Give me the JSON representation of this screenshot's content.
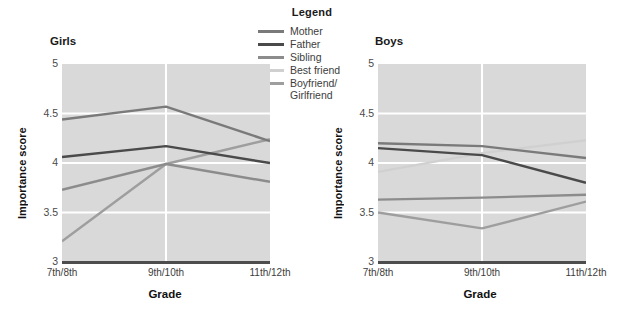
{
  "legend": {
    "title": "Legend",
    "entries": [
      {
        "label": "Mother",
        "color": "#7a7a7a"
      },
      {
        "label": "Father",
        "color": "#4a4a4a"
      },
      {
        "label": "Sibling",
        "color": "#8c8c8c"
      },
      {
        "label": "Best friend",
        "color": "#d0d0d0"
      },
      {
        "label": "Boyfriend/\nGirlfriend",
        "color": "#9e9e9e"
      }
    ]
  },
  "chart_data": [
    {
      "type": "line",
      "title": "Girls",
      "xlabel": "Grade",
      "ylabel": "Importance score",
      "categories": [
        "7th/8th",
        "9th/10th",
        "11th/12th"
      ],
      "ylim": [
        3,
        5
      ],
      "yticks": [
        3,
        3.5,
        4,
        4.5,
        5
      ],
      "grid": true,
      "legend_position": "top-center-shared",
      "series": [
        {
          "name": "Mother",
          "color": "#7a7a7a",
          "values": [
            4.44,
            4.57,
            4.22
          ]
        },
        {
          "name": "Father",
          "color": "#4a4a4a",
          "values": [
            4.06,
            4.17,
            4.0
          ]
        },
        {
          "name": "Sibling",
          "color": "#8c8c8c",
          "values": [
            3.73,
            3.99,
            3.81
          ]
        },
        {
          "name": "Best friend",
          "color": "#d0d0d0",
          "values": [
            null,
            null,
            null
          ]
        },
        {
          "name": "Boyfriend/Girlfriend",
          "color": "#9e9e9e",
          "values": [
            3.21,
            3.99,
            4.24
          ]
        }
      ]
    },
    {
      "type": "line",
      "title": "Boys",
      "xlabel": "Grade",
      "ylabel": "Importance score",
      "categories": [
        "7th/8th",
        "9th/10th",
        "11th/12th"
      ],
      "ylim": [
        3,
        5
      ],
      "yticks": [
        3,
        3.5,
        4,
        4.5,
        5
      ],
      "grid": true,
      "legend_position": "top-center-shared",
      "series": [
        {
          "name": "Mother",
          "color": "#7a7a7a",
          "values": [
            4.2,
            4.17,
            4.05
          ]
        },
        {
          "name": "Father",
          "color": "#4a4a4a",
          "values": [
            4.15,
            4.08,
            3.8
          ]
        },
        {
          "name": "Sibling",
          "color": "#8c8c8c",
          "values": [
            3.63,
            3.65,
            3.68
          ]
        },
        {
          "name": "Best friend",
          "color": "#d0d0d0",
          "values": [
            3.91,
            4.1,
            4.23
          ]
        },
        {
          "name": "Boyfriend/Girlfriend",
          "color": "#9e9e9e",
          "values": [
            3.5,
            3.34,
            3.61
          ]
        }
      ]
    }
  ]
}
